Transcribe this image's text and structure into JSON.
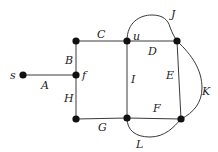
{
  "diagram": {
    "type": "graph",
    "colors": {
      "edge": "#3a3a3a",
      "node": "#111111",
      "label": "#222222",
      "background": "#ffffff"
    },
    "nodes": [
      {
        "id": "s",
        "label": "s",
        "x": 23,
        "y": 75
      },
      {
        "id": "tl",
        "label": "",
        "x": 76,
        "y": 41
      },
      {
        "id": "f",
        "label": "f",
        "x": 76,
        "y": 75
      },
      {
        "id": "bl",
        "label": "",
        "x": 76,
        "y": 119
      },
      {
        "id": "u",
        "label": "u",
        "x": 127,
        "y": 41
      },
      {
        "id": "tr",
        "label": "",
        "x": 177,
        "y": 41
      },
      {
        "id": "bm",
        "label": "",
        "x": 127,
        "y": 118
      },
      {
        "id": "br",
        "label": "",
        "x": 181,
        "y": 119
      }
    ],
    "edges": [
      {
        "id": "A",
        "label": "A",
        "from": "s",
        "to": "f"
      },
      {
        "id": "B",
        "label": "B",
        "from": "tl",
        "to": "f"
      },
      {
        "id": "C",
        "label": "C",
        "from": "tl",
        "to": "u"
      },
      {
        "id": "D",
        "label": "D",
        "from": "u",
        "to": "tr"
      },
      {
        "id": "E",
        "label": "E",
        "from": "tr",
        "to": "br"
      },
      {
        "id": "F",
        "label": "F",
        "from": "bm",
        "to": "br"
      },
      {
        "id": "G",
        "label": "G",
        "from": "bl",
        "to": "bm"
      },
      {
        "id": "H",
        "label": "H",
        "from": "f",
        "to": "bl"
      },
      {
        "id": "I",
        "label": "I",
        "from": "u",
        "to": "bm"
      },
      {
        "id": "J",
        "label": "J",
        "from": "u",
        "to": "tr",
        "curved": true
      },
      {
        "id": "K",
        "label": "K",
        "from": "tr",
        "to": "br",
        "curved": true
      },
      {
        "id": "L",
        "label": "L",
        "from": "bm",
        "to": "br",
        "curved": true
      }
    ]
  },
  "labels": {
    "s": "s",
    "f": "f",
    "u": "u",
    "A": "A",
    "B": "B",
    "C": "C",
    "D": "D",
    "E": "E",
    "F": "F",
    "G": "G",
    "H": "H",
    "I": "I",
    "J": "J",
    "K": "K",
    "L": "L"
  }
}
